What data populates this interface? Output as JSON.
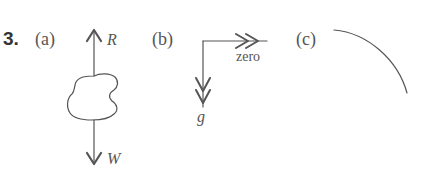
{
  "problem": {
    "number": "3.",
    "parts": [
      {
        "label": "(a)",
        "forces": [
          {
            "name": "R",
            "direction": "up"
          },
          {
            "name": "W",
            "direction": "down"
          }
        ],
        "object": "irregular body"
      },
      {
        "label": "(b)",
        "vectors": [
          {
            "name": "zero",
            "direction": "right",
            "arrowhead": "double"
          },
          {
            "name": "g",
            "direction": "down",
            "arrowhead": "double"
          }
        ]
      },
      {
        "label": "(c)",
        "shape": "quarter-circle arc"
      }
    ]
  },
  "colors": {
    "line": "#555555",
    "text": "#444444"
  }
}
